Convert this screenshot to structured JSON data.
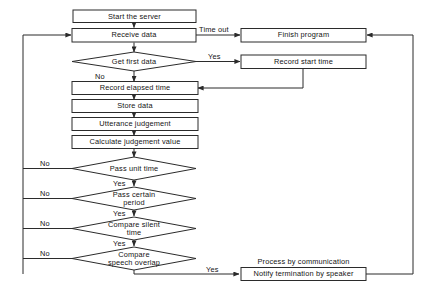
{
  "diagram": {
    "colors": {
      "line": "#2b2b2b",
      "text": "#141414",
      "background": "#ffffff",
      "node_fill": "#ffffff"
    },
    "nodes": [
      {
        "id": "start_server",
        "type": "process",
        "label": "Start the server"
      },
      {
        "id": "receive_data",
        "type": "process",
        "label": "Receive data"
      },
      {
        "id": "finish_program",
        "type": "process",
        "label": "Finish program"
      },
      {
        "id": "get_first_data",
        "type": "decision",
        "label": "Get first data"
      },
      {
        "id": "record_start_time",
        "type": "process",
        "label": "Record start time"
      },
      {
        "id": "record_elapsed",
        "type": "process",
        "label": "Record elapsed time"
      },
      {
        "id": "store_data",
        "type": "process",
        "label": "Store data"
      },
      {
        "id": "utterance_judge",
        "type": "process",
        "label": "Utterance judgement"
      },
      {
        "id": "calc_judge_value",
        "type": "process",
        "label": "Calculate judgement value"
      },
      {
        "id": "pass_unit_time",
        "type": "decision",
        "label": "Pass unit time"
      },
      {
        "id": "pass_certain_period",
        "type": "decision",
        "label_line1": "Pass certain",
        "label_line2": "period"
      },
      {
        "id": "compare_silent",
        "type": "decision",
        "label_line1": "Compare silent",
        "label_line2": "time"
      },
      {
        "id": "compare_overlap",
        "type": "decision",
        "label_line1": "Compare",
        "label_line2": "speech overlap"
      },
      {
        "id": "notify_termination",
        "type": "process",
        "label": "Notify termination by speaker"
      }
    ],
    "captions": [
      {
        "id": "process_by_communication",
        "label": "Process by communication"
      }
    ],
    "edge_labels": {
      "time_out": "Time out",
      "yes_first_data": "Yes",
      "no_first_data": "No",
      "no_unit_time": "No",
      "yes_unit_time": "Yes",
      "no_certain_period": "No",
      "yes_certain_period": "Yes",
      "no_silent": "No",
      "yes_silent": "Yes",
      "no_overlap": "No",
      "yes_overlap": "Yes"
    }
  }
}
